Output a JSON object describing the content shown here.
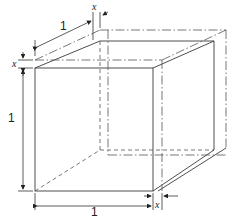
{
  "diagram": {
    "title": "",
    "labels": {
      "top_edge": "1",
      "top_offset": "x",
      "left_offset": "x",
      "left_edge": "1",
      "bottom_edge": "1",
      "bottom_offset": "x"
    },
    "colors": {
      "line": "#3a3a3a",
      "background": "#ffffff"
    }
  }
}
